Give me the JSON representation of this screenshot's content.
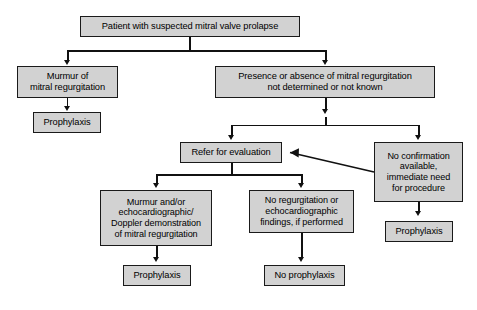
{
  "diagram": {
    "type": "flowchart",
    "colors": {
      "node_fill": "#d2d2d2",
      "node_border": "#1a1a1a",
      "connector": "#111111",
      "text": "#000000",
      "background": "#ffffff"
    },
    "nodes": [
      {
        "id": "root",
        "label": "Patient with suspected mitral valve prolapse"
      },
      {
        "id": "murmur",
        "label": "Murmur of\nmitral regurgitation"
      },
      {
        "id": "prophylaxis1",
        "label": "Prophylaxis"
      },
      {
        "id": "presence",
        "label": "Presence or absence of mitral regurgitation\nnot determined or not known"
      },
      {
        "id": "refer",
        "label": "Refer for evaluation"
      },
      {
        "id": "noconfirm",
        "label": "No confirmation\navailable,\nimmediate need\nfor procedure"
      },
      {
        "id": "prophylaxis2",
        "label": "Prophylaxis"
      },
      {
        "id": "murmurecho",
        "label": "Murmur and/or\nechocardiographic/\nDoppler demonstration\nof mitral regurgitation"
      },
      {
        "id": "noregurg",
        "label": "No regurgitation or\nechocardiographic\nfindings, if performed"
      },
      {
        "id": "prophylaxis3",
        "label": "Prophylaxis"
      },
      {
        "id": "noprophylaxis",
        "label": "No prophylaxis"
      }
    ],
    "edges": [
      {
        "from": "root",
        "to": "murmur"
      },
      {
        "from": "root",
        "to": "presence"
      },
      {
        "from": "murmur",
        "to": "prophylaxis1"
      },
      {
        "from": "presence",
        "to": "refer"
      },
      {
        "from": "presence",
        "to": "noconfirm"
      },
      {
        "from": "noconfirm",
        "to": "refer"
      },
      {
        "from": "noconfirm",
        "to": "prophylaxis2"
      },
      {
        "from": "refer",
        "to": "murmurecho"
      },
      {
        "from": "refer",
        "to": "noregurg"
      },
      {
        "from": "murmurecho",
        "to": "prophylaxis3"
      },
      {
        "from": "noregurg",
        "to": "noprophylaxis"
      }
    ]
  }
}
